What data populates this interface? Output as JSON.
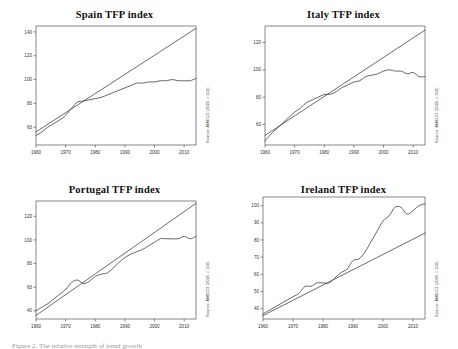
{
  "figure": {
    "caption": "Figure 2. The relative strength of trend growth",
    "source_note": "Source: AMECO (2005 = 100)"
  },
  "chart_data": [
    {
      "type": "line",
      "title": "Spain TFP index",
      "xlabel": "",
      "ylabel": "",
      "source": "Source: AMECO (2005 = 100)",
      "grid": false,
      "legend": "none",
      "xlim": [
        1960,
        2014
      ],
      "ylim": [
        45,
        145
      ],
      "xticks": [
        1960,
        1970,
        1980,
        1990,
        2000,
        2010
      ],
      "yticks": [
        60,
        80,
        100,
        120,
        140
      ],
      "series": [
        {
          "name": "TFP index",
          "x": [
            1960,
            1962,
            1964,
            1966,
            1968,
            1970,
            1972,
            1974,
            1976,
            1978,
            1980,
            1982,
            1984,
            1986,
            1988,
            1990,
            1992,
            1994,
            1996,
            1998,
            2000,
            2002,
            2004,
            2006,
            2008,
            2010,
            2012,
            2014
          ],
          "values": [
            53,
            56,
            60,
            63,
            66,
            70,
            76,
            81,
            82,
            83,
            84,
            85,
            87,
            89,
            91,
            93,
            95,
            97,
            97,
            98,
            98,
            99,
            99,
            100,
            99,
            99,
            99,
            101
          ]
        },
        {
          "name": "Linear trend",
          "x": [
            1960,
            2014
          ],
          "values": [
            56,
            143
          ]
        }
      ]
    },
    {
      "type": "line",
      "title": "Italy TFP index",
      "xlabel": "",
      "ylabel": "",
      "source": "Source: AMECO (2005 = 100)",
      "grid": false,
      "legend": "none",
      "xlim": [
        1960,
        2014
      ],
      "ylim": [
        45,
        132
      ],
      "xticks": [
        1960,
        1970,
        1980,
        1990,
        2000,
        2010
      ],
      "yticks": [
        60,
        80,
        100,
        120
      ],
      "series": [
        {
          "name": "TFP index",
          "x": [
            1960,
            1962,
            1964,
            1966,
            1968,
            1970,
            1972,
            1974,
            1976,
            1978,
            1980,
            1982,
            1984,
            1986,
            1988,
            1990,
            1992,
            1994,
            1996,
            1998,
            2000,
            2002,
            2004,
            2006,
            2008,
            2010,
            2012,
            2014
          ],
          "values": [
            48,
            53,
            57,
            61,
            65,
            69,
            72,
            76,
            78,
            80,
            82,
            82,
            84,
            87,
            89,
            91,
            92,
            95,
            96,
            97,
            99,
            100,
            99,
            99,
            97,
            98,
            95,
            95
          ]
        },
        {
          "name": "Linear trend",
          "x": [
            1960,
            2014
          ],
          "values": [
            52,
            129
          ]
        }
      ]
    },
    {
      "type": "line",
      "title": "Portugal TFP index",
      "xlabel": "",
      "ylabel": "",
      "source": "Source: AMECO (2005 = 100)",
      "grid": false,
      "legend": "none",
      "xlim": [
        1960,
        2014
      ],
      "ylim": [
        33,
        133
      ],
      "xticks": [
        1960,
        1970,
        1980,
        1990,
        2000,
        2010
      ],
      "yticks": [
        40,
        60,
        80,
        100,
        120
      ],
      "series": [
        {
          "name": "TFP index",
          "x": [
            1960,
            1962,
            1964,
            1966,
            1968,
            1970,
            1972,
            1974,
            1976,
            1978,
            1980,
            1982,
            1984,
            1986,
            1988,
            1990,
            1992,
            1994,
            1996,
            1998,
            2000,
            2002,
            2004,
            2006,
            2008,
            2010,
            2012,
            2014
          ],
          "values": [
            40,
            43,
            46,
            50,
            54,
            58,
            64,
            66,
            63,
            65,
            69,
            71,
            72,
            76,
            81,
            85,
            88,
            90,
            92,
            95,
            98,
            101,
            101,
            101,
            101,
            103,
            101,
            103
          ]
        },
        {
          "name": "Linear trend",
          "x": [
            1960,
            2014
          ],
          "values": [
            36,
            131
          ]
        }
      ]
    },
    {
      "type": "line",
      "title": "Ireland TFP index",
      "xlabel": "",
      "ylabel": "",
      "source": "Source: AMECO (2005 = 100)",
      "grid": false,
      "legend": "none",
      "xlim": [
        1960,
        2014
      ],
      "ylim": [
        34,
        105
      ],
      "xticks": [
        1960,
        1970,
        1980,
        1990,
        2000,
        2010
      ],
      "yticks": [
        40,
        50,
        60,
        70,
        80,
        90,
        100
      ],
      "series": [
        {
          "name": "TFP index",
          "x": [
            1960,
            1962,
            1964,
            1966,
            1968,
            1970,
            1972,
            1974,
            1976,
            1978,
            1980,
            1982,
            1984,
            1986,
            1988,
            1990,
            1992,
            1994,
            1996,
            1998,
            2000,
            2002,
            2004,
            2006,
            2008,
            2010,
            2012,
            2014
          ],
          "values": [
            37,
            39,
            41,
            43,
            45,
            47,
            49,
            53,
            53,
            55,
            55,
            55,
            58,
            61,
            63,
            68,
            69,
            73,
            79,
            85,
            91,
            94,
            99,
            99,
            95,
            97,
            100,
            101
          ]
        },
        {
          "name": "Linear trend",
          "x": [
            1960,
            2014
          ],
          "values": [
            36,
            84
          ]
        }
      ]
    }
  ]
}
